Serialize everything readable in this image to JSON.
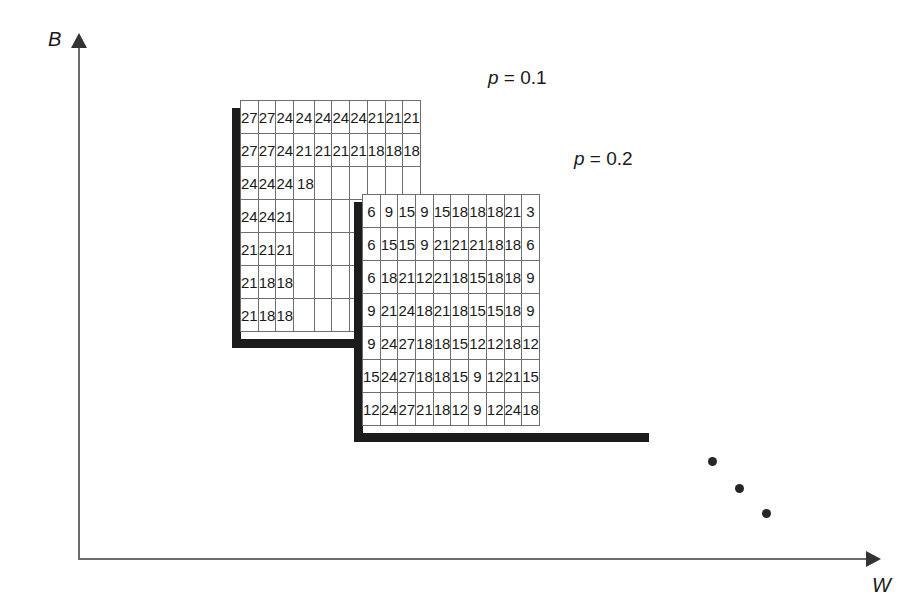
{
  "figure": {
    "axes": {
      "y_label": "B",
      "x_label": "W"
    },
    "annotations": {
      "p_label_1": "p = 0.1",
      "p_label_2": "p = 0.2",
      "p_symbol": "p",
      "p_value_1": "= 0.1",
      "p_value_2": "= 0.2"
    },
    "ellipsis": {
      "dot_count": 3,
      "positions": [
        {
          "x": 708,
          "y": 457
        },
        {
          "x": 735,
          "y": 484
        },
        {
          "x": 762,
          "y": 509
        }
      ]
    },
    "colors": {
      "grid_line": "#6e6e6e",
      "shadow": "#1c1c1c",
      "axis": "#6b6b6b",
      "text": "#1a1a1a",
      "background": "#ffffff"
    }
  },
  "chart_data": {
    "type": "heatmap",
    "title": "",
    "xlabel": "W",
    "ylabel": "B",
    "grid": true,
    "legend_position": "above-each-grid",
    "annotations": [
      "p = 0.1",
      "p = 0.2"
    ],
    "grids": [
      {
        "name": "grid-p-0-1",
        "label": "p = 0.1",
        "rows": 7,
        "cols": 10,
        "occluded_from_row": 3,
        "occluded_from_col": 4,
        "values": [
          [
            27,
            27,
            24,
            24,
            24,
            24,
            24,
            21,
            21,
            21
          ],
          [
            27,
            27,
            24,
            21,
            21,
            21,
            21,
            18,
            18,
            18
          ],
          [
            24,
            24,
            24,
            18,
            null,
            null,
            null,
            null,
            null,
            null
          ],
          [
            24,
            24,
            21,
            null,
            null,
            null,
            null,
            null,
            null,
            null
          ],
          [
            21,
            21,
            21,
            null,
            null,
            null,
            null,
            null,
            null,
            null
          ],
          [
            21,
            18,
            18,
            null,
            null,
            null,
            null,
            null,
            null,
            null
          ],
          [
            21,
            18,
            18,
            null,
            null,
            null,
            null,
            null,
            null,
            null
          ]
        ]
      },
      {
        "name": "grid-p-0-2",
        "label": "p = 0.2",
        "rows": 7,
        "cols": 10,
        "values": [
          [
            6,
            9,
            15,
            9,
            15,
            18,
            18,
            18,
            21,
            3
          ],
          [
            6,
            15,
            15,
            9,
            21,
            21,
            21,
            18,
            18,
            6
          ],
          [
            6,
            18,
            21,
            12,
            21,
            18,
            15,
            18,
            18,
            9
          ],
          [
            9,
            21,
            24,
            18,
            21,
            18,
            15,
            15,
            18,
            9
          ],
          [
            9,
            24,
            27,
            18,
            18,
            15,
            12,
            12,
            18,
            12
          ],
          [
            15,
            24,
            27,
            18,
            18,
            15,
            9,
            12,
            21,
            15
          ],
          [
            12,
            24,
            27,
            21,
            18,
            12,
            9,
            12,
            24,
            18
          ]
        ]
      }
    ]
  }
}
